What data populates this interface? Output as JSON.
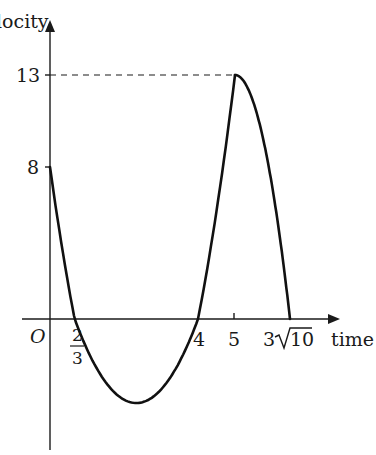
{
  "chart_data": {
    "type": "line",
    "title": "",
    "cropped_top_text": "velocity",
    "xlabel": "time",
    "ylabel": "velocity",
    "origin_label": "O",
    "x_ticks": [
      {
        "value": 0.6667,
        "label_num": "2",
        "label_den": "3",
        "kind": "fraction"
      },
      {
        "value": 4,
        "label": "4"
      },
      {
        "value": 5,
        "label": "5"
      },
      {
        "value": 9.4868,
        "label": "3√10",
        "coef": "3",
        "radicand": "10"
      }
    ],
    "y_ticks": [
      {
        "value": 8,
        "label": "8"
      },
      {
        "value": 13,
        "label": "13"
      }
    ],
    "series": [
      {
        "name": "velocity",
        "segments": [
          {
            "type": "quadratic",
            "formula": "v = 3(t - 2/3)(t - 4)",
            "t_range": [
              0,
              5
            ],
            "points": [
              [
                0,
                8
              ],
              [
                0.6667,
                0
              ],
              [
                2.3333,
                -8.33
              ],
              [
                4,
                0
              ],
              [
                5,
                13
              ]
            ]
          },
          {
            "type": "curve-down",
            "formula": "v = 13 - (t-5)^2 ... to zero",
            "t_range": [
              5,
              9.4868
            ],
            "points": [
              [
                5,
                13
              ],
              [
                9.4868,
                0
              ]
            ]
          }
        ]
      }
    ],
    "annotations": [
      {
        "type": "dashed-line",
        "from": [
          0,
          13
        ],
        "to": [
          5,
          13
        ]
      }
    ],
    "grid": false,
    "legend": "none"
  }
}
